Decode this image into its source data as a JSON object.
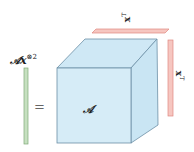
{
  "diagram": {
    "result_label": {
      "base": "𝒜x",
      "sup": "⊗2"
    },
    "equals_label": "=",
    "tensor_label": "𝒜",
    "top_vector_label": {
      "base": "x",
      "sup": "T"
    },
    "right_vector_label": {
      "base": "x",
      "sup": "T"
    }
  },
  "colors": {
    "cube_fill": "#d6ecf7",
    "cube_side": "#c9e5f3",
    "cube_top": "#cfe8f5",
    "cube_edge": "#6c8fa6",
    "vector_red_fill": "#f6c6c0",
    "vector_red_edge": "#e08880",
    "vector_green_fill": "#c6e0c0",
    "vector_green_edge": "#7fa878"
  }
}
